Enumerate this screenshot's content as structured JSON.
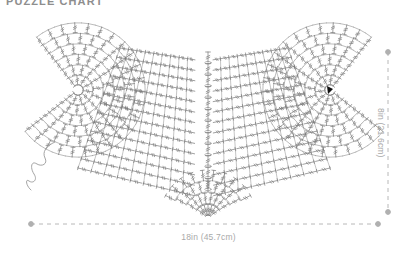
{
  "title": "PUZZLE CHART",
  "colors": {
    "stitch": "#7a7a7a",
    "stitch_light": "#9a9a9a",
    "dimension": "#b0b0b0",
    "label_text": "#a9a9a9",
    "title_text": "#8e8e8e",
    "background": "#ffffff",
    "start_marker": "#111111"
  },
  "dimensions": {
    "width_label": "18in (45.7cm)",
    "height_label": "8in (21.6cm)",
    "width_line": {
      "x1": 31,
      "x2": 378,
      "y": 224
    },
    "height_line": {
      "x": 388,
      "y1": 52,
      "y2": 212
    }
  },
  "diagram": {
    "name": "crochet-heart-stitch-chart",
    "shape": "heart",
    "left_fan_center": {
      "x": 78,
      "y": 90
    },
    "right_fan_center": {
      "x": 330,
      "y": 90
    },
    "bottom_point": {
      "x": 208,
      "y": 215
    },
    "yarn_tail": "curl at lower-left of left lobe",
    "start_marker_position": {
      "x": 330,
      "y": 90
    },
    "sections": [
      "left-radial-fan",
      "right-radial-fan",
      "left-grid-panel",
      "right-grid-panel",
      "center-spine",
      "bottom-triangle-point"
    ]
  },
  "chart_data": {
    "type": "table",
    "title": "PUZZLE CHART",
    "xlabel": "18in (45.7cm)",
    "ylabel": "8in (21.6cm)",
    "categories": [
      "Width",
      "Height"
    ],
    "values": [
      18,
      8
    ],
    "units_imperial": [
      "18in",
      "8in"
    ],
    "units_metric": [
      "45.7cm",
      "21.6cm"
    ]
  }
}
